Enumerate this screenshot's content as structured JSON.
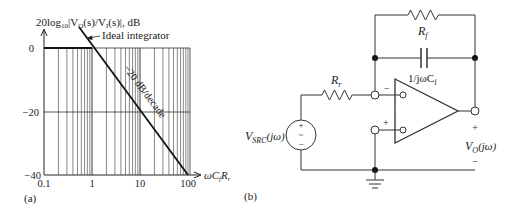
{
  "panel_a": {
    "label": "(a)",
    "y_axis_title": {
      "pre": "20log",
      "sub": "10",
      "mid1": "|V",
      "sub2": "O",
      "mid2": "(s)/V",
      "sub3": "I",
      "post": "(s)|, dB"
    },
    "x_axis_title": {
      "pre": "ωC",
      "sub": "f",
      "mid": "R",
      "sub2": "r"
    },
    "annotation_line": "Ideal integrator",
    "annotation_slope": "−20 dB/decade",
    "y_ticks": [
      "0",
      "−20",
      "−40"
    ],
    "x_ticks": [
      "0.1",
      "1",
      "10",
      "100"
    ]
  },
  "panel_b": {
    "label": "(b)",
    "feedback_resistor": {
      "name": "R",
      "sub": "f"
    },
    "feedback_capacitor": {
      "name": "1/jωC",
      "sub": "f"
    },
    "input_resistor": {
      "name": "R",
      "sub": "r"
    },
    "source": {
      "name": "V",
      "sub": "SRC",
      "post": "(jω)",
      "plus": "+",
      "tilde": "~",
      "minus": "−"
    },
    "opamp": {
      "inv_sign": "−",
      "noninv_sign": "+"
    },
    "output": {
      "name": "V",
      "sub": "O",
      "post": "(jω)",
      "plus": "+",
      "minus": "−"
    }
  },
  "chart_data": {
    "type": "line",
    "title": "20log10|VO(s)/VI(s)|, dB",
    "xlabel": "ωCfRr",
    "ylabel": "dB",
    "x_scale": "log",
    "xlim": [
      0.1,
      100
    ],
    "ylim": [
      -40,
      0
    ],
    "grid": true,
    "series": [
      {
        "name": "Ideal integrator",
        "x": [
          0.1,
          1,
          10,
          100
        ],
        "values": [
          20,
          0,
          -20,
          -40
        ]
      },
      {
        "name": "Asymptote 0 dB",
        "x": [
          0.1,
          1
        ],
        "values": [
          0,
          0
        ]
      }
    ],
    "annotations": [
      "Ideal integrator",
      "−20 dB/decade"
    ]
  }
}
